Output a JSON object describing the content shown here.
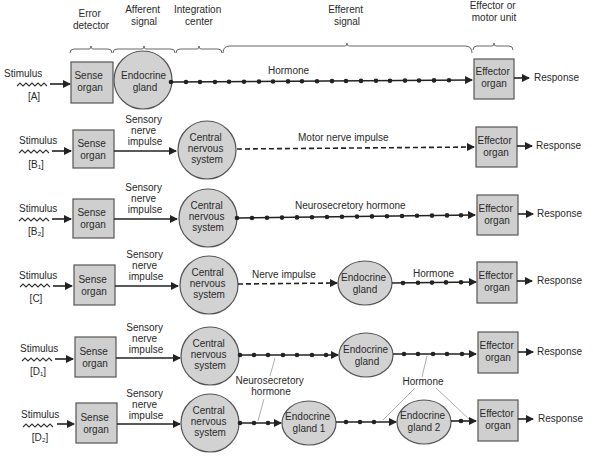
{
  "header_categories": [
    {
      "id": "error-detector",
      "lines": [
        "Error",
        "detector"
      ],
      "x1": 70,
      "x2": 112
    },
    {
      "id": "afferent-signal",
      "lines": [
        "Afferent",
        "signal"
      ],
      "x1": 113,
      "x2": 175
    },
    {
      "id": "integration-center",
      "lines": [
        "Integration",
        "center"
      ],
      "x1": 176,
      "x2": 222
    },
    {
      "id": "efferent-signal",
      "lines": [
        "Efferent",
        "signal"
      ],
      "x1": 223,
      "x2": 472
    },
    {
      "id": "effector-motor-unit",
      "lines": [
        "Effector or",
        "motor unit"
      ],
      "x1": 473,
      "x2": 513
    }
  ],
  "common": {
    "stimulus": "Stimulus",
    "response": "Response",
    "sense_organ": [
      "Sense",
      "organ"
    ],
    "cns": [
      "Central",
      "nervous",
      "system"
    ],
    "effector": [
      "Effector",
      "organ"
    ],
    "sensory_nerve_impulse": [
      "Sensory",
      "nerve",
      "impulse"
    ],
    "endocrine_gland": [
      "Endocrine",
      "gland"
    ]
  },
  "rows": [
    {
      "id": "A",
      "label": "[A]",
      "y": 80,
      "description": "Sense organ directly coupled to endocrine gland; hormone carried to effector organ",
      "signal_label": "Hormone"
    },
    {
      "id": "B1",
      "label": "[B₁]",
      "y": 150,
      "description": "Sense organ -> sensory nerve impulse -> CNS -> motor nerve impulse -> effector",
      "signal_label": "Motor nerve impulse"
    },
    {
      "id": "B2",
      "label": "[B₂]",
      "y": 217,
      "description": "Sense organ -> sensory nerve impulse -> CNS -> neurosecretory hormone -> effector",
      "signal_label": "Neurosecretory hormone"
    },
    {
      "id": "C",
      "label": "[C]",
      "y": 281,
      "description": "Sense organ -> CNS -> nerve impulse -> endocrine gland -> hormone -> effector",
      "signal_label_1": "Nerve impulse",
      "signal_label_2": "Hormone"
    },
    {
      "id": "D1",
      "label": "[D₁]",
      "y": 354,
      "description": "Sense organ -> CNS -> neurosecretory hormone -> endocrine gland -> hormone -> effector"
    },
    {
      "id": "D2",
      "label": "[D₂]",
      "y": 422,
      "description": "Sense organ -> CNS -> neurosecretory hormone -> endocrine gland 1 -> hormone -> endocrine gland 2 -> hormone -> effector",
      "gland1": [
        "Endocrine",
        "gland 1"
      ],
      "gland2": [
        "Endocrine",
        "gland 2"
      ]
    }
  ],
  "shared_annotations": {
    "neurosecretory_hormone": [
      "Neurosecretory",
      "hormone"
    ],
    "hormone": "Hormone"
  },
  "colors": {
    "node_fill": "#d0d0d0",
    "node_stroke": "#555555",
    "line": "#222222",
    "text": "#2a2a2a",
    "background": "#ffffff"
  }
}
